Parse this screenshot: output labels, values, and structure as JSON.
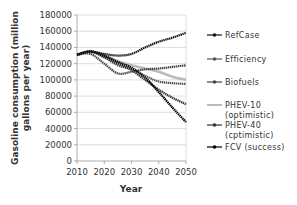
{
  "chart_data": {
    "type": "line",
    "title": "",
    "xlabel": "Year",
    "ylabel": "Gasoline consumption (million gallons per year)",
    "ylabel_lines": [
      "Gasoline consumption (million",
      "gallons per year)"
    ],
    "xlim": [
      2010,
      2050
    ],
    "ylim": [
      0,
      180000
    ],
    "x_ticks": [
      2010,
      2020,
      2030,
      2040,
      2050
    ],
    "y_ticks": [
      0,
      20000,
      40000,
      60000,
      80000,
      100000,
      120000,
      140000,
      160000,
      180000
    ],
    "grid": "horizontal",
    "legend_position": "right",
    "x": [
      2010,
      2015,
      2020,
      2025,
      2030,
      2035,
      2040,
      2045,
      2050
    ],
    "series": [
      {
        "name": "RefCase",
        "color": "#111111",
        "marker": "diamond",
        "values": [
          131000,
          135000,
          132000,
          130000,
          132000,
          140000,
          147000,
          152000,
          158000
        ]
      },
      {
        "name": "Efficiency",
        "color": "#555555",
        "marker": "square",
        "values": [
          131000,
          135000,
          128000,
          118000,
          113000,
          105000,
          98000,
          96000,
          95000
        ]
      },
      {
        "name": "Biofuels",
        "color": "#444444",
        "marker": "triangle",
        "values": [
          131000,
          132000,
          120000,
          108000,
          110000,
          113000,
          114000,
          116000,
          118000
        ]
      },
      {
        "name": "PHEV-10 (optimistic)",
        "color": "#bbbbbb",
        "marker": "none",
        "values": [
          131000,
          135000,
          130000,
          123000,
          118000,
          114000,
          110000,
          104000,
          100000
        ]
      },
      {
        "name": "PHEV-40 (cptimistic)",
        "color": "#333333",
        "marker": "x",
        "values": [
          131000,
          135000,
          128000,
          120000,
          112000,
          100000,
          88000,
          78000,
          70000
        ]
      },
      {
        "name": "FCV (success)",
        "color": "#000000",
        "marker": "circle",
        "values": [
          131000,
          135000,
          130000,
          122000,
          115000,
          103000,
          85000,
          66000,
          48000
        ]
      }
    ]
  },
  "legend": {
    "items": [
      {
        "line1": "RefCase",
        "line2": ""
      },
      {
        "line1": "Efficiency",
        "line2": ""
      },
      {
        "line1": "Biofuels",
        "line2": ""
      },
      {
        "line1": "PHEV-10",
        "line2": "(optimistic)"
      },
      {
        "line1": "PHEV-40",
        "line2": "(cptimistic)"
      },
      {
        "line1": "FCV (success)",
        "line2": ""
      }
    ]
  }
}
